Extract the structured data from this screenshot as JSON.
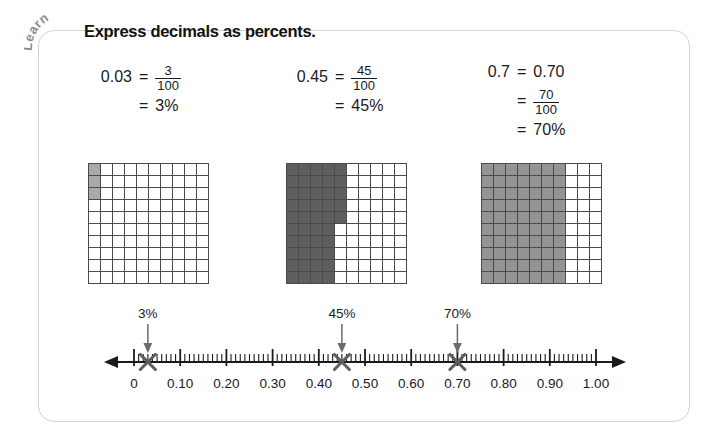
{
  "badge": {
    "label": "Learn"
  },
  "title": "Express decimals as percents.",
  "equations": [
    {
      "id": "eq-003",
      "decimal": "0.03",
      "fraction_num": "3",
      "fraction_den": "100",
      "percent": "3%",
      "eq_sign": "=",
      "lines": 2
    },
    {
      "id": "eq-045",
      "decimal": "0.45",
      "fraction_num": "45",
      "fraction_den": "100",
      "percent": "45%",
      "eq_sign": "=",
      "lines": 2
    },
    {
      "id": "eq-070",
      "decimal": "0.7",
      "expanded": "0.70",
      "fraction_num": "70",
      "fraction_den": "100",
      "percent": "70%",
      "eq_sign": "=",
      "lines": 3
    }
  ],
  "grids": [
    {
      "id": "grid-3",
      "rows": 10,
      "cols": 10,
      "shaded": 3,
      "fill_color": "#a9a9a9",
      "shade_style": "on-light",
      "label": "3 of 100 shaded"
    },
    {
      "id": "grid-45",
      "rows": 10,
      "cols": 10,
      "shaded": 45,
      "fill_color": "#5e5e5e",
      "shade_style": "on-dark",
      "label": "45 of 100 shaded"
    },
    {
      "id": "grid-70",
      "rows": 10,
      "cols": 10,
      "shaded": 70,
      "fill_color": "#949494",
      "shade_style": "on-mid",
      "label": "70 of 100 shaded"
    }
  ],
  "numberline": {
    "min": 0,
    "max": 1.0,
    "major_step": 0.1,
    "minor_step": 0.01,
    "tick_labels": [
      "0",
      "0.10",
      "0.20",
      "0.30",
      "0.40",
      "0.50",
      "0.60",
      "0.70",
      "0.80",
      "0.90",
      "1.00"
    ],
    "markers": [
      {
        "id": "marker-3",
        "value": 0.03,
        "label": "3%"
      },
      {
        "id": "marker-45",
        "value": 0.45,
        "label": "45%"
      },
      {
        "id": "marker-70",
        "value": 0.7,
        "label": "70%"
      }
    ],
    "marker_color": "#5e5e5e",
    "axis_color": "#1a1a1a"
  },
  "colors": {
    "card_border": "#d2d2d2",
    "text": "#1a1a1a",
    "badge_text": "#8c8c8c"
  }
}
